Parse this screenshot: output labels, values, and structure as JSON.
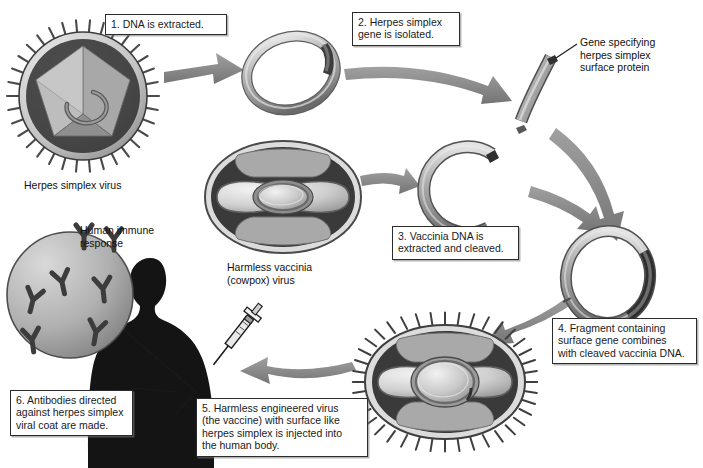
{
  "diagram": {
    "background_color": "#ffffff",
    "line_color": "#2b2b2b",
    "arrow_color": "#8a8a8a",
    "arrow_dark_color": "#6e6e6e",
    "dna_color": "#a8a8a8",
    "insert_color": "#4a4a4a",
    "silhouette_color": "#1a1a1a"
  },
  "steps": [
    {
      "id": "step1",
      "text": "1. DNA is extracted."
    },
    {
      "id": "step2",
      "text": "2. Herpes simplex\ngene is isolated."
    },
    {
      "id": "step3",
      "text": "3. Vaccinia DNA is\nextracted and cleaved."
    },
    {
      "id": "step4",
      "text": "4. Fragment containing\nsurface gene combines\nwith cleaved vaccinia DNA."
    },
    {
      "id": "step5",
      "text": "5. Harmless engineered virus\n(the vaccine) with surface like\nherpes simplex is injected into\nthe human body."
    },
    {
      "id": "step6",
      "text": "6. Antibodies directed\nagainst herpes simplex\nviral coat are made."
    }
  ],
  "labels": {
    "herpes_virus": "Herpes simplex virus",
    "gene_callout": "Gene specifying\nherpes simplex\nsurface protein",
    "vaccinia_virus": "Harmless vaccinia\n(cowpox) virus",
    "immune_response": "Human immune\nresponse"
  },
  "structures": [
    {
      "name": "herpes-simplex-virus",
      "kind": "icosahedral-enveloped-virus",
      "spikes": 34
    },
    {
      "name": "herpes-dna-circle",
      "kind": "closed-circular-dna"
    },
    {
      "name": "herpes-gene-fragment",
      "kind": "linear-dna-fragment"
    },
    {
      "name": "vaccinia-virus",
      "kind": "brick-shaped-virus"
    },
    {
      "name": "cleaved-vaccinia-dna",
      "kind": "open-circular-dna"
    },
    {
      "name": "recombinant-dna-circle",
      "kind": "circular-dna-with-insert"
    },
    {
      "name": "engineered-vaccine-virus",
      "kind": "brick-shaped-virus-with-spikes",
      "spikes": 40
    },
    {
      "name": "human-silhouette",
      "kind": "person-profile"
    },
    {
      "name": "syringe",
      "kind": "injection-needle"
    },
    {
      "name": "antibody-magnifier",
      "kind": "circle-with-antibodies",
      "antibodies": 7
    }
  ],
  "icons": {
    "antibody": "Y-shaped antibody",
    "arrow": "flow-arrow"
  }
}
